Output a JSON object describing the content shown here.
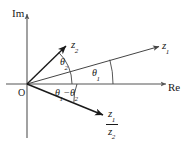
{
  "figure": {
    "background_color": "#ffffff",
    "line_color": "#1a1a1a",
    "axis_color": "#555555",
    "thin_line_color": "#444444"
  },
  "axes": {
    "imaginary_label": "Im",
    "real_label": "Re",
    "origin_label": "O"
  },
  "vectors": [
    {
      "id": "z1",
      "label": "z",
      "subscript": "1",
      "description": "vector z1 at small positive angle above real axis",
      "angle_deg": 16,
      "style": "thin-arrow"
    },
    {
      "id": "z2",
      "label": "z",
      "subscript": "2",
      "description": "vector z2 at larger positive angle above real axis",
      "angle_deg": 44,
      "style": "thick-arrow"
    },
    {
      "id": "z1_over_z2",
      "numerator": "z",
      "numerator_sub": "1",
      "denominator": "z",
      "denominator_sub": "2",
      "description": "vector z1/z2 below real axis",
      "angle_deg": -22,
      "style": "thick-arrow"
    }
  ],
  "angles": [
    {
      "id": "theta1",
      "symbol": "θ",
      "subscript": "1",
      "description": "angle of z1 measured from real axis"
    },
    {
      "id": "theta2",
      "symbol": "θ",
      "subscript": "2",
      "description": "angle of z2 measured from real axis"
    },
    {
      "id": "theta1_minus_theta2",
      "symbol_first": "θ",
      "subscript_first": "1",
      "operator": "−",
      "symbol_second": "θ",
      "subscript_second": "2",
      "description": "angle of z1/z2 measured below real axis"
    }
  ]
}
